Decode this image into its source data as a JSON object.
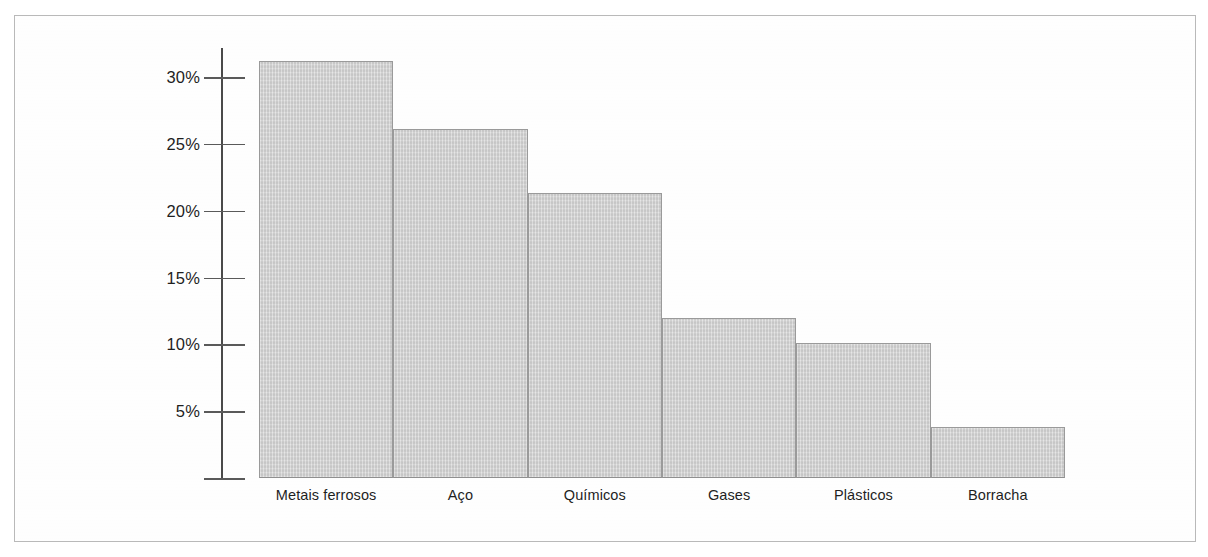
{
  "chart_data": {
    "type": "bar",
    "title": "",
    "subtitle": "",
    "xlabel": "",
    "ylabel": "",
    "categories": [
      "Metais ferrosos",
      "Aço",
      "Químicos",
      "Gases",
      "Plásticos",
      "Borracha"
    ],
    "values": [
      31.2,
      26.1,
      21.3,
      12.0,
      10.1,
      3.8
    ],
    "value_unit": "%",
    "ylim": [
      0,
      32
    ],
    "yticks": [
      0,
      5,
      10,
      15,
      20,
      25,
      30
    ],
    "ytick_labels": [
      "",
      "5%",
      "10%",
      "15%",
      "20%",
      "25%",
      "30%"
    ],
    "grid": false,
    "legend": false,
    "legend_position": "none",
    "bar_fill_color": "#d5d5d5",
    "bar_edge_color": "#9a9a9a",
    "axis_color": "#4a4a4a",
    "background_color": "#ffffff",
    "frame_color": "#b9b9b9"
  },
  "axis": {
    "ticks": [
      {
        "label": "30%",
        "value": 30
      },
      {
        "label": "25%",
        "value": 25
      },
      {
        "label": "20%",
        "value": 20
      },
      {
        "label": "15%",
        "value": 15
      },
      {
        "label": "10%",
        "value": 10
      },
      {
        "label": "5%",
        "value": 5
      },
      {
        "label": "",
        "value": 0
      }
    ]
  },
  "bars": [
    {
      "label": "Metais ferrosos",
      "value": 31.2
    },
    {
      "label": "Aço",
      "value": 26.1
    },
    {
      "label": "Químicos",
      "value": 21.3
    },
    {
      "label": "Gases",
      "value": 12.0
    },
    {
      "label": "Plásticos",
      "value": 10.1
    },
    {
      "label": "Borracha",
      "value": 3.8
    }
  ]
}
